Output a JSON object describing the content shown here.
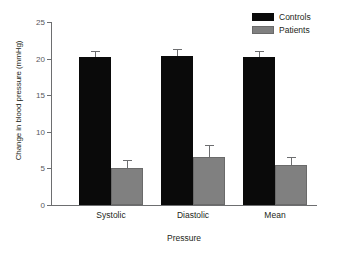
{
  "chart_data": {
    "type": "bar",
    "title": "",
    "xlabel": "Pressure",
    "ylabel": "Change in blood pressure (mmHg)",
    "categories": [
      "Systolic",
      "Diastolic",
      "Mean"
    ],
    "series": [
      {
        "name": "Controls",
        "color": "#0a0a0a",
        "values": [
          20.2,
          20.3,
          20.2
        ],
        "errors": [
          0.9,
          1.0,
          0.9
        ]
      },
      {
        "name": "Patients",
        "color": "#808080",
        "values": [
          5.0,
          6.5,
          5.5
        ],
        "errors": [
          1.2,
          1.7,
          1.1
        ]
      }
    ],
    "ylim": [
      0,
      25
    ],
    "yticks": [
      0,
      5,
      10,
      15,
      20,
      25
    ],
    "ytick_labels": [
      "0",
      "5",
      "10",
      "15",
      "20",
      "25"
    ],
    "grid": false,
    "legend_position": "top-right",
    "error_bar_style": "upper-only-cap"
  },
  "legend": {
    "entries": [
      {
        "label": "Controls"
      },
      {
        "label": "Patients"
      }
    ]
  },
  "artifact": {
    "bottom_text": ""
  }
}
